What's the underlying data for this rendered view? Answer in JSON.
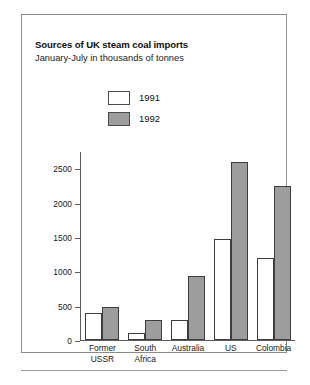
{
  "chart_data": {
    "type": "bar",
    "title": "Sources of UK steam coal imports",
    "subtitle": "January-July in thousands of tonnes",
    "xlabel": "",
    "ylabel": "",
    "categories": [
      "Former USSR",
      "South Africa",
      "Australia",
      "US",
      "Colombia"
    ],
    "series": [
      {
        "name": "1991",
        "values": [
          390,
          100,
          300,
          1480,
          1200
        ],
        "color": "#ffffff"
      },
      {
        "name": "1992",
        "values": [
          490,
          300,
          930,
          2600,
          2250
        ],
        "color": "#9d9d9d"
      }
    ],
    "ylim": [
      0,
      2750
    ],
    "yticks": [
      0,
      500,
      1000,
      1500,
      2000,
      2500
    ],
    "ytick_labels": [
      "0",
      "500",
      "1000",
      "1500",
      "2000",
      "2500"
    ],
    "grid": false,
    "legend_position": "top-center"
  },
  "legend": {
    "items": [
      {
        "label": "1991",
        "swatch": "white-swatch"
      },
      {
        "label": "1992",
        "swatch": "gray-swatch"
      }
    ]
  },
  "category_lines": [
    [
      "Former",
      "USSR"
    ],
    [
      "South",
      "Africa"
    ],
    [
      "Australia",
      ""
    ],
    [
      "US",
      ""
    ],
    [
      "Colombia",
      ""
    ]
  ]
}
